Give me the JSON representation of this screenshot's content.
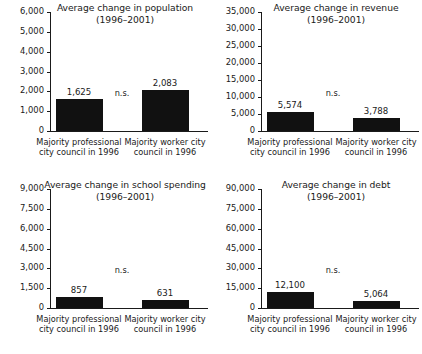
{
  "figure": {
    "panel_count": 4,
    "significance_note": "n.s.",
    "period": "(1996–2001)",
    "bar_color": "#111111",
    "axis_color": "#1a1a1a",
    "background": "#ffffff"
  },
  "chart_data": [
    {
      "type": "bar",
      "title": "Average change in population",
      "subtitle": "(1996–2001)",
      "categories": [
        "Majority professional city council in 1996",
        "Majority worker city council in 1996"
      ],
      "category_lines": [
        [
          "Majority professional",
          "city council in 1996"
        ],
        [
          "Majority worker city",
          "council in 1996"
        ]
      ],
      "values": [
        1625,
        2083
      ],
      "value_labels": [
        "1,625",
        "2,083"
      ],
      "ylim": [
        0,
        6000
      ],
      "yticks": [
        0,
        1000,
        2000,
        3000,
        4000,
        5000,
        6000
      ],
      "ytick_labels": [
        "0",
        "1,000",
        "2,000",
        "3,000",
        "4,000",
        "5,000",
        "6,000"
      ],
      "xlabel": "",
      "ylabel": "",
      "grid": false,
      "legend": null,
      "annotation": "n.s."
    },
    {
      "type": "bar",
      "title": "Average change in revenue",
      "subtitle": "(1996–2001)",
      "categories": [
        "Majority professional city council in 1996",
        "Majority worker city council in 1996"
      ],
      "category_lines": [
        [
          "Majority professional",
          "city council in 1996"
        ],
        [
          "Majority worker city",
          "council in 1996"
        ]
      ],
      "values": [
        5574,
        3788
      ],
      "value_labels": [
        "5,574",
        "3,788"
      ],
      "ylim": [
        0,
        35000
      ],
      "yticks": [
        0,
        5000,
        10000,
        15000,
        20000,
        25000,
        30000,
        35000
      ],
      "ytick_labels": [
        "0",
        "5,000",
        "10,000",
        "15,000",
        "20,000",
        "25,000",
        "30,000",
        "35,000"
      ],
      "xlabel": "",
      "ylabel": "",
      "grid": false,
      "legend": null,
      "annotation": "n.s."
    },
    {
      "type": "bar",
      "title": "Average change in school spending",
      "subtitle": "(1996–2001)",
      "categories": [
        "Majority professional city council in 1996",
        "Majority worker city council in 1996"
      ],
      "category_lines": [
        [
          "Majority professional",
          "city council in 1996"
        ],
        [
          "Majority worker city",
          "council in 1996"
        ]
      ],
      "values": [
        857,
        631
      ],
      "value_labels": [
        "857",
        "631"
      ],
      "ylim": [
        0,
        9000
      ],
      "yticks": [
        0,
        1500,
        3000,
        4500,
        6000,
        7500,
        9000
      ],
      "ytick_labels": [
        "0",
        "1,500",
        "3,000",
        "4,500",
        "6,000",
        "7,500",
        "9,000"
      ],
      "xlabel": "",
      "ylabel": "",
      "grid": false,
      "legend": null,
      "annotation": "n.s."
    },
    {
      "type": "bar",
      "title": "Average change in debt",
      "subtitle": "(1996–2001)",
      "categories": [
        "Majority professional city council in 1996",
        "Majority worker city council in 1996"
      ],
      "category_lines": [
        [
          "Majority professional",
          "city council in 1996"
        ],
        [
          "Majority worker city",
          "council in 1996"
        ]
      ],
      "values": [
        12100,
        5064
      ],
      "value_labels": [
        "12,100",
        "5,064"
      ],
      "ylim": [
        0,
        90000
      ],
      "yticks": [
        0,
        15000,
        30000,
        45000,
        60000,
        75000,
        90000
      ],
      "ytick_labels": [
        "0",
        "15,000",
        "30,000",
        "45,000",
        "60,000",
        "75,000",
        "90,000"
      ],
      "xlabel": "",
      "ylabel": "",
      "grid": false,
      "legend": null,
      "annotation": "n.s."
    }
  ]
}
